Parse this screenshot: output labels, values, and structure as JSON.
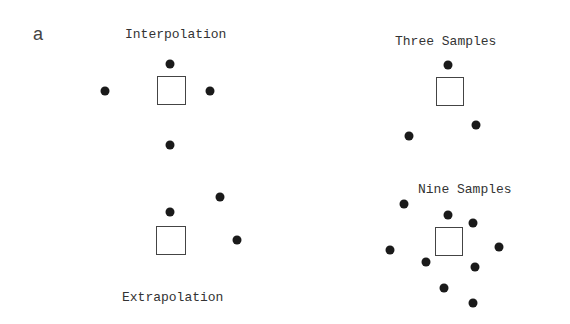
{
  "panel_letter": "a",
  "panels": {
    "interpolation": {
      "title": "Interpolation",
      "query_square": {
        "x": 157,
        "y": 76,
        "w": 29,
        "h": 29
      },
      "samples": [
        [
          170,
          64
        ],
        [
          105,
          91
        ],
        [
          210,
          91
        ],
        [
          170,
          145
        ]
      ]
    },
    "extrapolation": {
      "title": "Extrapolation",
      "query_square": {
        "x": 156,
        "y": 226,
        "w": 30,
        "h": 29
      },
      "samples": [
        [
          170,
          212
        ],
        [
          220,
          197
        ],
        [
          237,
          240
        ]
      ]
    },
    "three_samples": {
      "title": "Three Samples",
      "query_square": {
        "x": 436,
        "y": 77,
        "w": 28,
        "h": 29
      },
      "samples": [
        [
          448,
          65
        ],
        [
          476,
          125
        ],
        [
          409,
          136
        ]
      ]
    },
    "nine_samples": {
      "title": "Nine Samples",
      "query_square": {
        "x": 435,
        "y": 227,
        "w": 28,
        "h": 29
      },
      "samples": [
        [
          404,
          204
        ],
        [
          448,
          215
        ],
        [
          473,
          223
        ],
        [
          390,
          250
        ],
        [
          499,
          247
        ],
        [
          426,
          262
        ],
        [
          475,
          267
        ],
        [
          444,
          288
        ],
        [
          473,
          303
        ]
      ]
    }
  },
  "colors": {
    "dot": "#1a1a1a",
    "square_border": "#444444",
    "text": "#333333"
  }
}
